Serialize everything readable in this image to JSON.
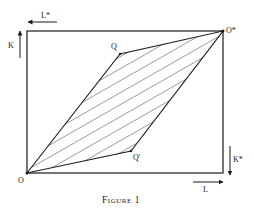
{
  "diagram": {
    "caption": "FIGURE 1",
    "caption_first": "F",
    "caption_rest": "IGURE",
    "caption_num": "1",
    "box": {
      "x1": 27,
      "y1": 31,
      "x2": 223,
      "y2": 173
    },
    "points": {
      "O": {
        "label": "O",
        "x": 27,
        "y": 173
      },
      "O_star": {
        "label": "O*",
        "x": 223,
        "y": 31
      },
      "Q": {
        "label": "Q",
        "x": 120,
        "y": 54
      },
      "Q_prime": {
        "label": "Q'",
        "x": 131,
        "y": 151
      }
    },
    "axes": {
      "L_star": {
        "label": "L*",
        "direction": "left"
      },
      "K": {
        "label": "K",
        "direction": "up"
      },
      "K_star": {
        "label": "K*",
        "direction": "down"
      },
      "L": {
        "label": "L",
        "direction": "right"
      }
    },
    "hatching": {
      "lines": 9,
      "orientation": "parallel to O–O* diagonal"
    },
    "colors": {
      "ink": "#1a1a1a",
      "hatch": "#555555",
      "background": "#ffffff"
    }
  }
}
